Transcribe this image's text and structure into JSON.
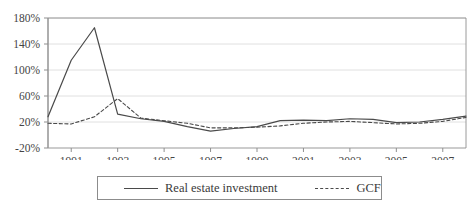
{
  "chart_data": {
    "type": "line",
    "title": "",
    "xlabel": "",
    "ylabel": "",
    "x": [
      1990,
      1991,
      1992,
      1993,
      1994,
      1995,
      1996,
      1997,
      1998,
      1999,
      2000,
      2001,
      2002,
      2003,
      2004,
      2005,
      2006,
      2007,
      2008
    ],
    "xlim": [
      1990,
      2008
    ],
    "ylim": [
      -20,
      180
    ],
    "yticks": [
      -20,
      20,
      60,
      100,
      140,
      180
    ],
    "ytick_labels": [
      "-20%",
      "20%",
      "60%",
      "100%",
      "140%",
      "180%"
    ],
    "xtick_labels": [
      "1991",
      "1993",
      "1995",
      "1997",
      "1999",
      "2001",
      "2003",
      "2005",
      "2007"
    ],
    "xtick_values": [
      1991,
      1993,
      1995,
      1997,
      1999,
      2001,
      2003,
      2005,
      2007
    ],
    "grid": "horizontal",
    "legend_position": "bottom",
    "series": [
      {
        "name": "Real estate investment",
        "style": "solid",
        "color": "#4a4a4a",
        "values": [
          28,
          115,
          165,
          32,
          25,
          21,
          13,
          6,
          10,
          13,
          22,
          23,
          22,
          25,
          24,
          19,
          20,
          24,
          29
        ]
      },
      {
        "name": "GCF",
        "style": "dashed",
        "color": "#4a4a4a",
        "values": [
          18,
          17,
          28,
          56,
          26,
          22,
          18,
          11,
          11,
          12,
          14,
          18,
          20,
          21,
          19,
          17,
          18,
          21,
          27
        ]
      }
    ]
  },
  "legend": {
    "series1_label": "Real estate investment",
    "series2_label": "GCF"
  }
}
